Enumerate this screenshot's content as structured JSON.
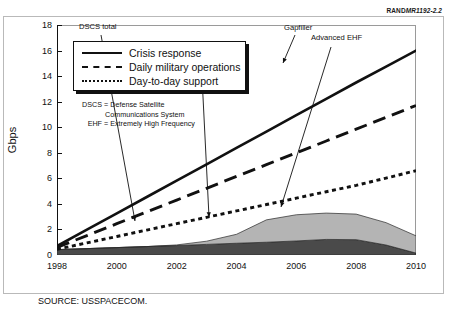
{
  "figure": {
    "report_id_prefix": "RAND",
    "report_id": "MR1192-2.2",
    "source": "SOURCE: USSPACECOM."
  },
  "legend": {
    "items": [
      {
        "label": "Crisis response",
        "style": "solid"
      },
      {
        "label": "Daily military operations",
        "style": "dashed"
      },
      {
        "label": "Day-to-day support",
        "style": "dotted"
      }
    ]
  },
  "notes": [
    {
      "key": "DSCS",
      "eq": "=",
      "text": "Defense Satellite",
      "cont": "Communications System"
    },
    {
      "key": "EHF",
      "eq": "=",
      "text": "Extremely High Frequency",
      "cont": ""
    }
  ],
  "annotations": [
    {
      "name": "dscs-total",
      "label": "DSCS total"
    },
    {
      "name": "milstar",
      "label": "MILSTAR"
    },
    {
      "name": "gapfiller",
      "label": "Gapfiller"
    },
    {
      "name": "advanced-ehf",
      "label": "Advanced EHF"
    }
  ],
  "chart_data": {
    "type": "area",
    "title": "",
    "xlabel": "",
    "ylabel": "Gbps",
    "xlim": [
      1998,
      2010
    ],
    "ylim": [
      0,
      18
    ],
    "yticks": [
      0,
      2,
      4,
      6,
      8,
      10,
      12,
      14,
      16,
      18
    ],
    "xticks": [
      1998,
      2000,
      2002,
      2004,
      2006,
      2008,
      2010
    ],
    "ytick_labels": [
      "0",
      "2",
      "4",
      "6",
      "8",
      "10",
      "12",
      "14",
      "16",
      "18"
    ],
    "xtick_labels": [
      "1998",
      "2000",
      "2002",
      "2004",
      "2006",
      "2008",
      "2010"
    ],
    "grid": false,
    "legend_position": "upper-left",
    "x": [
      1998,
      1999,
      2000,
      2001,
      2002,
      2003,
      2004,
      2005,
      2006,
      2007,
      2008,
      2009,
      2010
    ],
    "demand_series": [
      {
        "name": "Crisis response",
        "style": "solid",
        "values": [
          0.7,
          1.98,
          3.26,
          4.54,
          5.82,
          7.1,
          8.38,
          9.66,
          10.94,
          12.22,
          13.5,
          14.75,
          16.0
        ]
      },
      {
        "name": "Daily military operations",
        "style": "dashed",
        "values": [
          0.6,
          1.52,
          2.45,
          3.37,
          4.3,
          5.22,
          6.15,
          7.07,
          8.0,
          8.92,
          9.85,
          10.77,
          11.7
        ]
      },
      {
        "name": "Day-to-day support",
        "style": "dotted",
        "values": [
          0.45,
          0.95,
          1.45,
          1.95,
          2.45,
          2.95,
          3.45,
          3.95,
          4.45,
          4.95,
          5.45,
          6.02,
          6.6
        ]
      }
    ],
    "capacity_stack": [
      {
        "name": "DSCS total",
        "fill": "#4a4a4a",
        "values": [
          0.42,
          0.5,
          0.58,
          0.66,
          0.74,
          0.83,
          0.92,
          1.0,
          1.1,
          1.22,
          1.2,
          0.78,
          0.15
        ]
      },
      {
        "name": "Gapfiller / Advanced EHF",
        "fill": "#b4b4b4",
        "values": [
          0.0,
          0.0,
          0.0,
          0.0,
          0.05,
          0.25,
          0.7,
          1.75,
          2.05,
          2.06,
          2.0,
          1.75,
          1.35
        ]
      }
    ],
    "capacity_total_label": "Total satellite capacity",
    "colors": {
      "line": "#111111",
      "dscs_fill": "#4a4a4a",
      "gapfiller_fill": "#b4b4b4",
      "axis": "#111111",
      "frame": "#9a9a9a"
    }
  }
}
